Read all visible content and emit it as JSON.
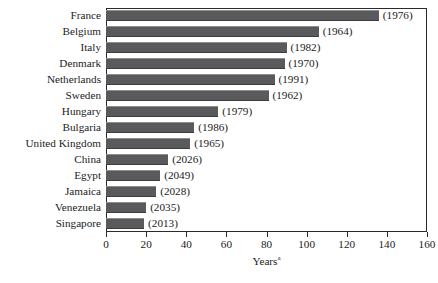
{
  "chart_data": {
    "type": "bar",
    "orientation": "horizontal",
    "title": "",
    "subtitle": "",
    "xlabel": "Years",
    "xlabel_footnote_marker": "a",
    "ylabel": "",
    "xlim": [
      0,
      160
    ],
    "xticks": [
      0,
      20,
      40,
      60,
      80,
      100,
      120,
      140,
      160
    ],
    "xtick_labels": [
      "0",
      "20",
      "40",
      "60",
      "80",
      "100",
      "120",
      "140",
      "160"
    ],
    "grid": false,
    "legend": null,
    "bar_color": "#5a5a5c",
    "axis_color": "#2a2a2a",
    "text_color": "#1b1b1b",
    "categories": [
      "France",
      "Belgium",
      "Italy",
      "Denmark",
      "Netherlands",
      "Sweden",
      "Hungary",
      "Bulgaria",
      "United Kingdom",
      "China",
      "Egypt",
      "Jamaica",
      "Venezuela",
      "Singapore"
    ],
    "values": [
      136,
      106,
      90,
      89,
      84,
      81,
      56,
      44,
      42,
      31,
      27,
      25,
      20,
      19
    ],
    "point_labels": [
      "(1976)",
      "(1964)",
      "(1982)",
      "(1970)",
      "(1991)",
      "(1962)",
      "(1979)",
      "(1986)",
      "(1965)",
      "(2026)",
      "(2049)",
      "(2028)",
      "(2035)",
      "(2013)"
    ],
    "rows": [
      {
        "category": "France",
        "value": 136,
        "label": "(1976)"
      },
      {
        "category": "Belgium",
        "value": 106,
        "label": "(1964)"
      },
      {
        "category": "Italy",
        "value": 90,
        "label": "(1982)"
      },
      {
        "category": "Denmark",
        "value": 89,
        "label": "(1970)"
      },
      {
        "category": "Netherlands",
        "value": 84,
        "label": "(1991)"
      },
      {
        "category": "Sweden",
        "value": 81,
        "label": "(1962)"
      },
      {
        "category": "Hungary",
        "value": 56,
        "label": "(1979)"
      },
      {
        "category": "Bulgaria",
        "value": 44,
        "label": "(1986)"
      },
      {
        "category": "United Kingdom",
        "value": 42,
        "label": "(1965)"
      },
      {
        "category": "China",
        "value": 31,
        "label": "(2026)"
      },
      {
        "category": "Egypt",
        "value": 27,
        "label": "(2049)"
      },
      {
        "category": "Jamaica",
        "value": 25,
        "label": "(2028)"
      },
      {
        "category": "Venezuela",
        "value": 20,
        "label": "(2035)"
      },
      {
        "category": "Singapore",
        "value": 19,
        "label": "(2013)"
      }
    ]
  }
}
